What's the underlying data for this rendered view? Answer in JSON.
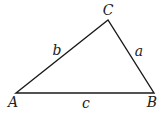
{
  "diagram": {
    "type": "triangle",
    "stroke_color": "#1a1a1a",
    "background": "#ffffff",
    "vertices": {
      "A": {
        "label": "A",
        "x": 16,
        "y": 93
      },
      "B": {
        "label": "B",
        "x": 154,
        "y": 93
      },
      "C": {
        "label": "C",
        "x": 108,
        "y": 20
      }
    },
    "sides": {
      "a": {
        "label": "a",
        "from": "B",
        "to": "C"
      },
      "b": {
        "label": "b",
        "from": "A",
        "to": "C"
      },
      "c": {
        "label": "c",
        "from": "A",
        "to": "B"
      }
    }
  }
}
